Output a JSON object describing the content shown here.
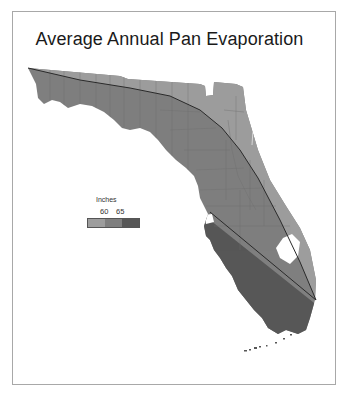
{
  "title": "Average Annual Pan Evaporation",
  "legend": {
    "title": "Inches",
    "ticks": [
      "60",
      "65"
    ],
    "classes": [
      {
        "label": "< 60",
        "color": "#9d9d9d"
      },
      {
        "label": "60 - 65",
        "color": "#7f7f7f"
      },
      {
        "label": "> 65",
        "color": "#575757"
      }
    ]
  },
  "map": {
    "region": "Florida",
    "zones": [
      {
        "name": "north-band",
        "class": "< 60",
        "color": "#9d9d9d"
      },
      {
        "name": "central-band",
        "class": "60 - 65",
        "color": "#7f7f7f"
      },
      {
        "name": "south-band",
        "class": "> 65",
        "color": "#575757"
      }
    ],
    "lake_color": "#ffffff",
    "boundary_line_color": "#2a2a2a",
    "county_line_color": "#6e6e6e"
  }
}
